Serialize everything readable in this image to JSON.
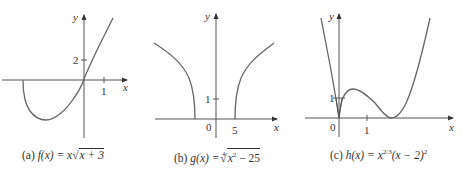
{
  "figures": [
    {
      "id": "a",
      "caption_prefix": "(a) ",
      "func_name": "f",
      "var": "x",
      "caption_lhs": "f(x) = x",
      "caption_radicand": "x + 3",
      "axis_x_label": "x",
      "axis_y_label": "y",
      "tick_x": "1",
      "tick_y": "2"
    },
    {
      "id": "b",
      "caption_prefix": "(b) ",
      "caption_lhs": "g(x) = ",
      "root_index": "4",
      "caption_radicand_base": "x",
      "caption_radicand_exp": "2",
      "caption_radicand_rest": " − 25",
      "axis_x_label": "x",
      "axis_y_label": "y",
      "origin_label": "0",
      "tick_x": "5",
      "tick_y": "1"
    },
    {
      "id": "c",
      "caption_prefix": "(c) ",
      "caption_lhs": "h(x) = x",
      "exp1": "2/3",
      "caption_mid": "(x − 2)",
      "exp2": "2",
      "axis_x_label": "x",
      "axis_y_label": "y",
      "origin_label": "0",
      "tick_x": "1",
      "tick_y": "1"
    }
  ],
  "colors": {
    "axis": "#555555",
    "curve": "#666666",
    "text": "#333333"
  }
}
